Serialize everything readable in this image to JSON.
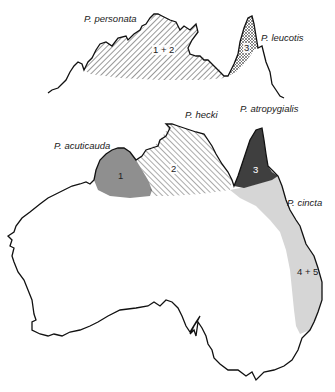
{
  "figure": {
    "inset_map": {
      "labels": {
        "species_a": "P. personata",
        "species_b": "P. leucotis"
      },
      "regions": [
        {
          "id": "1+2",
          "label": "1 + 2",
          "fill": "diagonal-hatch"
        },
        {
          "id": "3",
          "label": "3",
          "fill": "crosshatch"
        }
      ]
    },
    "main_map": {
      "labels": {
        "acuticauda": "P. acuticauda",
        "hecki": "P. hecki",
        "atropygialis": "P. atropygialis",
        "cincta": "P. cincta"
      },
      "regions": [
        {
          "id": "1",
          "label": "1",
          "fill": "#8f8f8f"
        },
        {
          "id": "2",
          "label": "2",
          "fill": "diagonal-hatch"
        },
        {
          "id": "3",
          "label": "3",
          "fill": "#3f3f3f"
        },
        {
          "id": "4+5",
          "label": "4 + 5",
          "fill": "#d6d6d6"
        }
      ]
    },
    "colors": {
      "coastline": "#111111",
      "region_1": "#8f8f8f",
      "region_3": "#3f3f3f",
      "region_45": "#d6d6d6",
      "hatch": "#333333"
    }
  }
}
